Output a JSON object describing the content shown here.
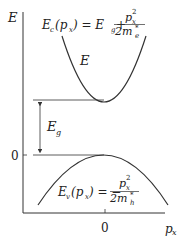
{
  "diagram": {
    "axes": {
      "y_label": "E",
      "x_label": "p",
      "x_label_sub": "x",
      "x_tick": "0",
      "y_tick": "0"
    },
    "conduction_band": {
      "curve_label": "E",
      "formula": {
        "lhs": "E",
        "lhs_sub": "c",
        "arg": "(p",
        "arg_sub": "x",
        "arg_close": ") = E",
        "eg_sub": "g",
        "plus": "+",
        "num": "p",
        "num_sub": "x",
        "num_sup": "2",
        "den": "2m",
        "den_sub": "e",
        "den_sup": "*"
      }
    },
    "valence_band": {
      "formula": {
        "lhs": "E",
        "lhs_sub": "v",
        "arg": "(p",
        "arg_sub": "x",
        "arg_close": ") = −",
        "num": "p",
        "num_sub": "x",
        "num_sup": "2",
        "den": "2m",
        "den_sub": "h",
        "den_sup": "*"
      }
    },
    "gap": {
      "label": "E",
      "label_sub": "g"
    },
    "colors": {
      "line": "#333333",
      "text": "#222222"
    }
  }
}
